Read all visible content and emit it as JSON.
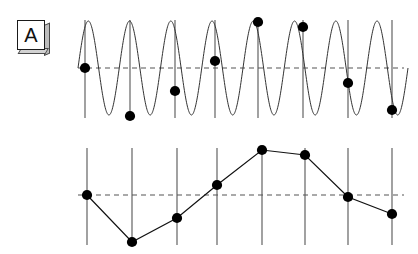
{
  "figure": {
    "background_color": "#ffffff",
    "width": 418,
    "height": 254,
    "ink_color": "#111111",
    "sample_line_color": "#555555",
    "baseline_color": "#555555",
    "dot_color": "#000000",
    "dot_radius": 5.1,
    "curve_color": "#333333"
  },
  "panels": [
    {
      "id": "panel-a",
      "label": "A",
      "label_name": "panel-label-a",
      "caption": "High-frequency sine wave with sampling instants"
    },
    {
      "id": "panel-b",
      "label": "B",
      "label_name": "panel-label-b",
      "caption": "Reconstructed low-frequency alias through the same samples"
    }
  ],
  "chart_data": [
    {
      "type": "line",
      "id": "panel-a",
      "title": "A",
      "subtitle": "Original high-frequency sine wave with sample points",
      "xlabel": "",
      "ylabel": "",
      "grid": false,
      "legend": "none",
      "xlim": [
        60,
        418
      ],
      "ylim": [
        20,
        118
      ],
      "baseline_y": 68,
      "baseline_style": "dashed",
      "baseline_x_range": [
        78,
        404
      ],
      "sample_line_y_range": [
        20,
        118
      ],
      "sample_lines_x": [
        85,
        130,
        175,
        215,
        258,
        303,
        348,
        392
      ],
      "series": [
        {
          "name": "continuous-sine",
          "style": "solid",
          "description": "Sine wave, approximately 8 cycles across the panel",
          "amplitude": 47,
          "midline": 68,
          "cycles": 8,
          "x_start": 78,
          "x_end": 408
        },
        {
          "name": "samples",
          "style": "markers",
          "x": [
            85,
            130,
            175,
            215,
            258,
            303,
            348,
            392
          ],
          "y": [
            68,
            116,
            91,
            61,
            22,
            27,
            83,
            110
          ]
        }
      ]
    },
    {
      "type": "line",
      "id": "panel-b",
      "title": "B",
      "subtitle": "Aliased reconstruction: samples joined by straight segments",
      "xlabel": "",
      "ylabel": "",
      "grid": false,
      "legend": "none",
      "xlim": [
        60,
        418
      ],
      "ylim": [
        148,
        245
      ],
      "baseline_y": 195,
      "baseline_style": "dashed",
      "baseline_x_range": [
        78,
        404
      ],
      "sample_line_y_range": [
        148,
        245
      ],
      "sample_lines_x": [
        87,
        132,
        177,
        217,
        262,
        305,
        348,
        392
      ],
      "series": [
        {
          "name": "reconstructed-alias",
          "style": "solid-with-markers",
          "x": [
            87,
            132,
            177,
            217,
            262,
            305,
            348,
            392
          ],
          "y": [
            195,
            242,
            218,
            185,
            150,
            155,
            197,
            214
          ]
        }
      ]
    }
  ]
}
